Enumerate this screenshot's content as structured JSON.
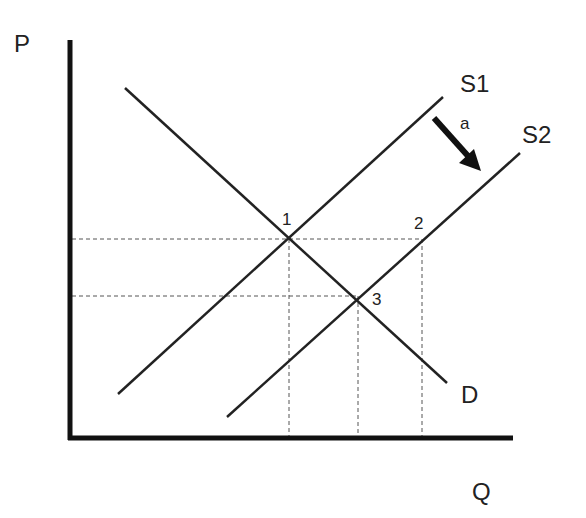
{
  "diagram": {
    "type": "supply-demand",
    "axes": {
      "y_label": "P",
      "x_label": "Q"
    },
    "curves": {
      "demand_label": "D",
      "supply1_label": "S1",
      "supply2_label": "S2"
    },
    "shift": {
      "label": "a",
      "direction": "S1 to S2 (rightward/downward supply shift)"
    },
    "points": [
      {
        "label": "1",
        "description": "intersection of D and S1"
      },
      {
        "label": "2",
        "description": "point on S2 at original price"
      },
      {
        "label": "3",
        "description": "intersection of D and S2"
      }
    ],
    "colors": {
      "line": "#222222",
      "axis": "#111111",
      "guide": "#555555"
    }
  }
}
